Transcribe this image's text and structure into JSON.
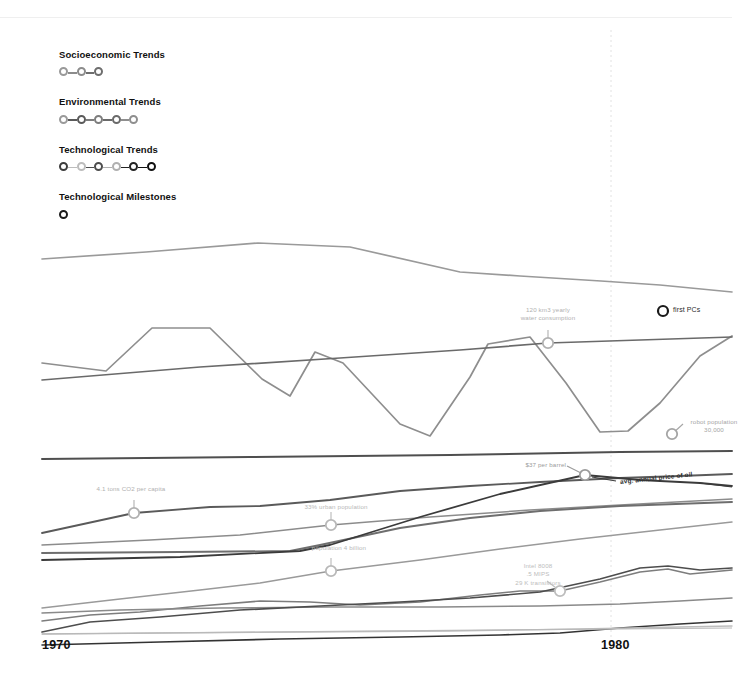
{
  "figure": {
    "background": "#ffffff",
    "width": 732,
    "height": 686
  },
  "legend": {
    "groups": [
      {
        "title": "Socioeconomic Trends",
        "name": "socioeconomic",
        "dots": [
          {
            "color": "#999999"
          },
          {
            "color": "#8c8c8c"
          },
          {
            "color": "#6e6e6e"
          }
        ]
      },
      {
        "title": "Environmental Trends",
        "name": "environmental",
        "dots": [
          {
            "color": "#9a9a9a"
          },
          {
            "color": "#5a5a5a"
          },
          {
            "color": "#7d7d7d"
          },
          {
            "color": "#6a6a6a"
          },
          {
            "color": "#8e8e8e"
          }
        ]
      },
      {
        "title": "Technological Trends",
        "name": "technological",
        "dots": [
          {
            "color": "#3c3c3c"
          },
          {
            "color": "#bdbdbd"
          },
          {
            "color": "#4d4d4d"
          },
          {
            "color": "#b0b0b0"
          },
          {
            "color": "#232323"
          },
          {
            "color": "#111111"
          }
        ]
      },
      {
        "title": "Technological Milestones",
        "name": "milestones",
        "dots": [
          {
            "color": "#1a1a1a"
          }
        ]
      }
    ]
  },
  "axis": {
    "ticks": [
      {
        "label": "1970",
        "x": 42
      },
      {
        "label": "1980",
        "x": 601
      }
    ],
    "baseline_color": "#b9b9b9",
    "gridline_color": "#e2e2e2",
    "gridline_x": 611
  },
  "annotations": [
    {
      "name": "water-consumption",
      "text": "120 km3 yearly\nwater consumption",
      "marker_x": 548,
      "marker_y": 343,
      "leader": "up",
      "align": "center",
      "label_x": 505,
      "label_y": 306,
      "color": "#b0b0b0"
    },
    {
      "name": "co2-per-capita",
      "text": "4.1 tons CO2 per capita",
      "marker_x": 134,
      "marker_y": 513,
      "leader": "up",
      "align": "center",
      "label_x": 88,
      "label_y": 485,
      "color": "#b0b0b0"
    },
    {
      "name": "urban-population",
      "text": "33% urban population",
      "marker_x": 331,
      "marker_y": 525,
      "leader": "up",
      "align": "center",
      "label_x": 293,
      "label_y": 503,
      "color": "#b8b8b8"
    },
    {
      "name": "world-population",
      "text": "population 4 billion",
      "marker_x": 331,
      "marker_y": 571,
      "leader": "up",
      "align": "center",
      "label_x": 296,
      "label_y": 544,
      "color": "#b8b8b8"
    },
    {
      "name": "oil-price",
      "text": "$37 per barrel",
      "marker_x": 585,
      "marker_y": 475,
      "leader": "diag-left",
      "align": "right",
      "label_x": 520,
      "label_y": 461,
      "color": "#9b9b9b"
    },
    {
      "name": "robot-population",
      "text": "robot population\n30,000",
      "marker_x": 672,
      "marker_y": 434,
      "leader": "diag-up-right",
      "align": "center",
      "label_x": 671,
      "label_y": 418,
      "color": "#a5a5a5"
    },
    {
      "name": "intel-8008",
      "text": "Intel 8008\n.5 MIPS\n29 K transistors",
      "marker_x": 560,
      "marker_y": 591,
      "leader": "diag-up-left",
      "align": "center",
      "label_x": 495,
      "label_y": 562,
      "color": "#bdbdbd"
    }
  ],
  "series_label": {
    "name": "avg-annual-price-of-oil",
    "text": "avg. annual price of oil",
    "x": 620,
    "y": 478
  },
  "milestones": [
    {
      "name": "first-pcs",
      "label": "first PCs",
      "x": 663,
      "y": 311,
      "color": "#1a1a1a"
    }
  ],
  "chart_data": {
    "type": "line",
    "title": "",
    "xlabel": "",
    "ylabel": "",
    "xlim": [
      1970,
      1981
    ],
    "grid": false,
    "legend_position": "top-left",
    "x": [
      1970,
      1971,
      1972,
      1973,
      1974,
      1975,
      1976,
      1977,
      1978,
      1979,
      1980,
      1981
    ],
    "series": [
      {
        "name": "stratospheric ozone",
        "group": "environmental",
        "color": "#9a9a9a",
        "width": 1.7,
        "points": [
          [
            42,
            259
          ],
          [
            146,
            252
          ],
          [
            258,
            243
          ],
          [
            350,
            247
          ],
          [
            460,
            272
          ],
          [
            520,
            276
          ],
          [
            601,
            281
          ],
          [
            660,
            285
          ],
          [
            732,
            292
          ]
        ]
      },
      {
        "name": "marine fish capture",
        "group": "environmental",
        "color": "#8e8e8e",
        "width": 1.7,
        "points": [
          [
            42,
            363
          ],
          [
            106,
            371
          ],
          [
            152,
            328
          ],
          [
            210,
            328
          ],
          [
            262,
            379
          ],
          [
            290,
            396
          ],
          [
            315,
            352
          ],
          [
            343,
            363
          ],
          [
            400,
            424
          ],
          [
            430,
            436
          ],
          [
            470,
            377
          ],
          [
            488,
            344
          ],
          [
            530,
            337
          ],
          [
            566,
            383
          ],
          [
            600,
            432
          ],
          [
            628,
            431
          ],
          [
            660,
            403
          ],
          [
            700,
            356
          ],
          [
            732,
            336
          ]
        ]
      },
      {
        "name": "water use",
        "group": "environmental",
        "color": "#6a6a6a",
        "width": 1.7,
        "points": [
          [
            42,
            380
          ],
          [
            200,
            367
          ],
          [
            340,
            358
          ],
          [
            460,
            350
          ],
          [
            548,
            343
          ],
          [
            640,
            340
          ],
          [
            732,
            337
          ]
        ]
      },
      {
        "name": "terrestrial biosphere degradation",
        "group": "environmental",
        "color": "#4f4f4f",
        "width": 2.0,
        "points": [
          [
            42,
            459
          ],
          [
            250,
            457
          ],
          [
            450,
            455
          ],
          [
            620,
            452
          ],
          [
            732,
            451
          ]
        ]
      },
      {
        "name": "CO2 emissions per capita",
        "group": "environmental",
        "color": "#5a5a5a",
        "width": 1.8,
        "points": [
          [
            42,
            533
          ],
          [
            134,
            513
          ],
          [
            210,
            507
          ],
          [
            260,
            506
          ],
          [
            330,
            500
          ],
          [
            400,
            491
          ],
          [
            470,
            486
          ],
          [
            540,
            482
          ],
          [
            620,
            478
          ],
          [
            680,
            476
          ],
          [
            732,
            474
          ]
        ]
      },
      {
        "name": "urban population",
        "group": "socioeconomic",
        "color": "#8c8c8c",
        "width": 1.5,
        "points": [
          [
            42,
            545
          ],
          [
            150,
            540
          ],
          [
            240,
            535
          ],
          [
            331,
            525
          ],
          [
            430,
            517
          ],
          [
            530,
            510
          ],
          [
            620,
            505
          ],
          [
            732,
            499
          ]
        ]
      },
      {
        "name": "primary energy use",
        "group": "socioeconomic",
        "color": "#6e6e6e",
        "width": 1.9,
        "points": [
          [
            42,
            553
          ],
          [
            180,
            552
          ],
          [
            290,
            551
          ],
          [
            320,
            545
          ],
          [
            400,
            528
          ],
          [
            470,
            518
          ],
          [
            540,
            511
          ],
          [
            620,
            506
          ],
          [
            732,
            502
          ]
        ]
      },
      {
        "name": "avg. annual price of oil",
        "group": "socioeconomic",
        "color": "#3b3b3b",
        "width": 1.8,
        "points": [
          [
            42,
            560
          ],
          [
            180,
            557
          ],
          [
            300,
            551
          ],
          [
            330,
            545
          ],
          [
            420,
            517
          ],
          [
            500,
            494
          ],
          [
            585,
            475
          ],
          [
            640,
            480
          ],
          [
            700,
            483
          ],
          [
            732,
            486
          ]
        ]
      },
      {
        "name": "world population",
        "group": "socioeconomic",
        "color": "#9a9a9a",
        "width": 1.5,
        "points": [
          [
            42,
            608
          ],
          [
            120,
            599
          ],
          [
            200,
            590
          ],
          [
            260,
            583
          ],
          [
            331,
            571
          ],
          [
            420,
            560
          ],
          [
            500,
            549
          ],
          [
            580,
            539
          ],
          [
            660,
            530
          ],
          [
            732,
            522
          ]
        ]
      },
      {
        "name": "transistor count",
        "group": "technological",
        "color": "#7d7d7d",
        "width": 1.6,
        "points": [
          [
            42,
            621
          ],
          [
            90,
            615
          ],
          [
            140,
            612
          ],
          [
            200,
            606
          ],
          [
            260,
            601
          ],
          [
            310,
            602
          ],
          [
            360,
            605
          ],
          [
            420,
            602
          ],
          [
            480,
            595
          ],
          [
            520,
            591
          ],
          [
            560,
            591
          ],
          [
            600,
            582
          ],
          [
            640,
            572
          ],
          [
            668,
            569
          ],
          [
            690,
            574
          ],
          [
            732,
            570
          ]
        ]
      },
      {
        "name": "telecommunications",
        "group": "technological",
        "color": "#8a8a8a",
        "width": 1.5,
        "points": [
          [
            42,
            613
          ],
          [
            120,
            610
          ],
          [
            220,
            608
          ],
          [
            330,
            607
          ],
          [
            440,
            607
          ],
          [
            540,
            606
          ],
          [
            620,
            604
          ],
          [
            680,
            601
          ],
          [
            732,
            598
          ]
        ]
      },
      {
        "name": "robot population",
        "group": "technological",
        "color": "#4d4d4d",
        "width": 1.7,
        "points": [
          [
            42,
            632
          ],
          [
            90,
            622
          ],
          [
            160,
            617
          ],
          [
            240,
            610
          ],
          [
            320,
            606
          ],
          [
            400,
            602
          ],
          [
            470,
            598
          ],
          [
            540,
            592
          ],
          [
            600,
            579
          ],
          [
            640,
            568
          ],
          [
            668,
            566
          ],
          [
            700,
            570
          ],
          [
            732,
            568
          ]
        ]
      },
      {
        "name": "computing power",
        "group": "technological",
        "color": "#333333",
        "width": 1.6,
        "points": [
          [
            42,
            645
          ],
          [
            160,
            642
          ],
          [
            280,
            639
          ],
          [
            400,
            637
          ],
          [
            500,
            635
          ],
          [
            560,
            633
          ],
          [
            620,
            628
          ],
          [
            680,
            624
          ],
          [
            732,
            621
          ]
        ]
      },
      {
        "name": "paper production",
        "group": "socioeconomic",
        "color": "#bdbdbd",
        "width": 1.4,
        "points": [
          [
            42,
            634
          ],
          [
            160,
            633
          ],
          [
            300,
            632
          ],
          [
            450,
            631
          ],
          [
            580,
            629
          ],
          [
            680,
            627
          ],
          [
            732,
            626
          ]
        ]
      }
    ]
  }
}
